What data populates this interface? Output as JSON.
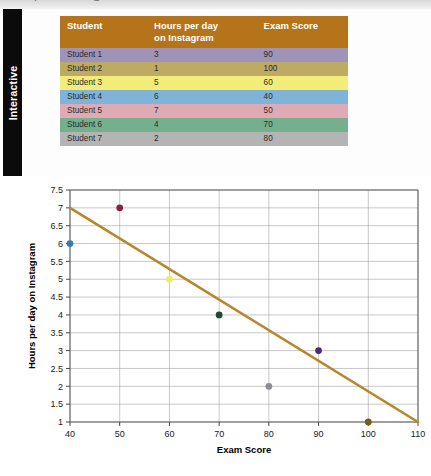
{
  "page": {
    "cut_off_top_text": "I  G",
    "background": "#ffffff"
  },
  "rail": {
    "label": "Interactive",
    "background": "#0b0b0b",
    "text_color": "#ffffff"
  },
  "table": {
    "header_bg": "#b5731a",
    "header_text_color": "#ffffff",
    "columns": [
      {
        "key": "student",
        "label": "Student"
      },
      {
        "key": "hours",
        "label": "Hours per day\non Instagram",
        "label_line1": "Hours per day",
        "label_line2": "on Instagram"
      },
      {
        "key": "score",
        "label": "Exam Score"
      }
    ],
    "rows": [
      {
        "student": "Student 1",
        "hours": "3",
        "score": "90",
        "row_color": "#9f93b8"
      },
      {
        "student": "Student 2",
        "hours": "1",
        "score": "100",
        "row_color": "#bdab63"
      },
      {
        "student": "Student 3",
        "hours": "5",
        "score": "60",
        "row_color": "#f2ec78"
      },
      {
        "student": "Student 4",
        "hours": "6",
        "score": "40",
        "row_color": "#7fb4d8"
      },
      {
        "student": "Student 5",
        "hours": "7",
        "score": "50",
        "row_color": "#e0aab4"
      },
      {
        "student": "Student 6",
        "hours": "4",
        "score": "70",
        "row_color": "#74b08d"
      },
      {
        "student": "Student 7",
        "hours": "2",
        "score": "80",
        "row_color": "#b4b4b4"
      }
    ]
  },
  "chart_data": {
    "type": "scatter",
    "title": "",
    "xlabel": "Exam Score",
    "ylabel": "Hours per day on Instagram",
    "xlim": [
      40,
      110
    ],
    "ylim": [
      1,
      7.5
    ],
    "xticks": [
      40,
      50,
      60,
      70,
      80,
      90,
      100,
      110
    ],
    "yticks": [
      1,
      1.5,
      2,
      2.5,
      3,
      3.5,
      4,
      4.5,
      5,
      5.5,
      6,
      6.5,
      7,
      7.5
    ],
    "xtick_labels": [
      "40",
      "50",
      "60",
      "70",
      "80",
      "90",
      "100",
      "110"
    ],
    "ytick_labels": [
      "1",
      "1.5",
      "2",
      "2.5",
      "3",
      "3.5",
      "4",
      "4.5",
      "5",
      "5.5",
      "6",
      "6.5",
      "7",
      "7.5"
    ],
    "grid": true,
    "legend": false,
    "points": [
      {
        "label": "Student 4",
        "x": 40,
        "y": 6,
        "color": "#2f7fb5"
      },
      {
        "label": "Student 5",
        "x": 50,
        "y": 7,
        "color": "#8e1f43"
      },
      {
        "label": "Student 3",
        "x": 60,
        "y": 5,
        "color": "#f0ea6a"
      },
      {
        "label": "Student 6",
        "x": 70,
        "y": 4,
        "color": "#1d4d2e"
      },
      {
        "label": "Student 7",
        "x": 80,
        "y": 2,
        "color": "#8c8c94"
      },
      {
        "label": "Student 1",
        "x": 90,
        "y": 3,
        "color": "#4b2b72"
      },
      {
        "label": "Student 2",
        "x": 100,
        "y": 1,
        "color": "#7a5a1e"
      }
    ],
    "trendline": {
      "color": "#b8862b",
      "x1": 40,
      "y1": 7,
      "x2": 110,
      "y2": 1
    }
  }
}
